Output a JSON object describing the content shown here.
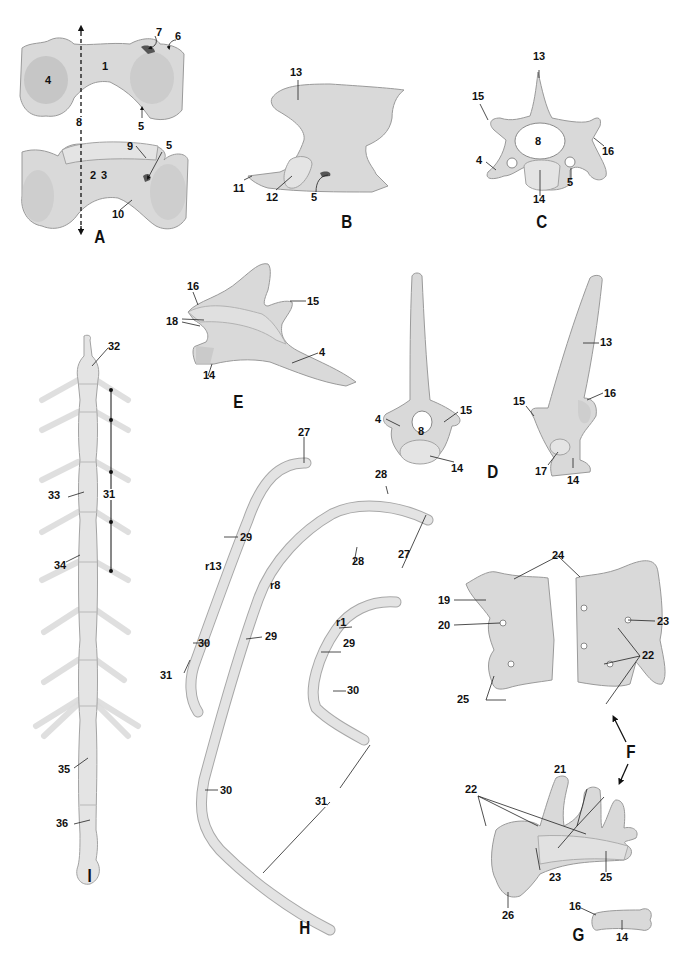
{
  "figure": {
    "panels": [
      {
        "id": "A",
        "label": "A",
        "callouts": [
          "1",
          "2",
          "3",
          "4",
          "5",
          "5",
          "6",
          "7",
          "8",
          "9",
          "10"
        ]
      },
      {
        "id": "B",
        "label": "B",
        "callouts": [
          "5",
          "11",
          "12",
          "13"
        ]
      },
      {
        "id": "C",
        "label": "C",
        "callouts": [
          "4",
          "5",
          "8",
          "13",
          "14",
          "15",
          "16"
        ]
      },
      {
        "id": "D",
        "label": "D",
        "callouts": [
          "4",
          "8",
          "13",
          "14",
          "14",
          "15",
          "15",
          "16",
          "17"
        ]
      },
      {
        "id": "E",
        "label": "E",
        "callouts": [
          "4",
          "14",
          "15",
          "16",
          "18"
        ]
      },
      {
        "id": "F",
        "label": "F",
        "callouts": [
          "19",
          "20",
          "21",
          "22",
          "22",
          "23",
          "23",
          "24",
          "25",
          "25",
          "26"
        ]
      },
      {
        "id": "G",
        "label": "G",
        "callouts": [
          "14",
          "16"
        ]
      },
      {
        "id": "H",
        "label": "H",
        "callouts": [
          "r13",
          "r8",
          "r1",
          "27",
          "27",
          "28",
          "28",
          "29",
          "29",
          "29",
          "30",
          "30",
          "30",
          "31",
          "31"
        ]
      },
      {
        "id": "I",
        "label": "I",
        "callouts": [
          "31",
          "32",
          "33",
          "34",
          "35",
          "36"
        ]
      }
    ]
  },
  "labels": {
    "A": {
      "panel": "A",
      "l1": "1",
      "l2": "2",
      "l3": "3",
      "l4": "4",
      "l5a": "5",
      "l5b": "5",
      "l6": "6",
      "l7": "7",
      "l8": "8",
      "l9": "9",
      "l10": "10"
    },
    "B": {
      "panel": "B",
      "l5": "5",
      "l11": "11",
      "l12": "12",
      "l13": "13"
    },
    "C": {
      "panel": "C",
      "l4": "4",
      "l5": "5",
      "l8": "8",
      "l13": "13",
      "l14": "14",
      "l15": "15",
      "l16": "16"
    },
    "D": {
      "panel": "D",
      "l4": "4",
      "l8": "8",
      "l15a": "15",
      "l14a": "14",
      "l13": "13",
      "l16": "16",
      "l15b": "15",
      "l17": "17",
      "l14b": "14"
    },
    "E": {
      "panel": "E",
      "l16": "16",
      "l15": "15",
      "l18": "18",
      "l4": "4",
      "l14": "14"
    },
    "F": {
      "panel": "F",
      "l24": "24",
      "l19": "19",
      "l20": "20",
      "l23a": "23",
      "l22a": "22",
      "l25a": "25",
      "l21": "21",
      "l22b": "22",
      "l23b": "23",
      "l25b": "25",
      "l26": "26"
    },
    "G": {
      "panel": "G",
      "l16": "16",
      "l14": "14"
    },
    "H": {
      "panel": "H",
      "l27a": "27",
      "l29a": "29",
      "r13": "r13",
      "l30a": "30",
      "l31a": "31",
      "l28a": "28",
      "r8": "r8",
      "l29b": "29",
      "l30b": "30",
      "l27b": "27",
      "l28b": "28",
      "r1": "r1",
      "l29c": "29",
      "l30c": "30",
      "l31b": "31"
    },
    "I": {
      "panel": "I",
      "l32": "32",
      "l33": "33",
      "l31": "31",
      "l34": "34",
      "l35": "35",
      "l36": "36"
    }
  }
}
